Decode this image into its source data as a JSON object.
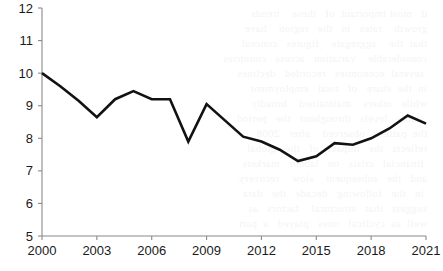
{
  "chart_data": {
    "type": "line",
    "title": "",
    "subtitle": "",
    "xlabel": "",
    "ylabel": "",
    "xlim": [
      2000,
      2021
    ],
    "ylim": [
      5,
      12
    ],
    "grid": false,
    "legend": null,
    "legend_position": "none",
    "y_ticks": [
      5,
      6,
      7,
      8,
      9,
      10,
      11,
      12
    ],
    "y_tick_labels": [
      "5",
      "6",
      "7",
      "8",
      "9",
      "10",
      "11",
      "12"
    ],
    "x_ticks": [
      2000,
      2003,
      2006,
      2009,
      2012,
      2015,
      2018,
      2021
    ],
    "x_tick_labels": [
      "2000",
      "2003",
      "2006",
      "2009",
      "2012",
      "2015",
      "2018",
      "2021"
    ],
    "x": [
      2000,
      2001,
      2002,
      2003,
      2004,
      2005,
      2006,
      2007,
      2008,
      2009,
      2010,
      2011,
      2012,
      2013,
      2014,
      2015,
      2016,
      2017,
      2018,
      2019,
      2020,
      2021
    ],
    "values": [
      10.0,
      9.6,
      9.15,
      8.65,
      9.2,
      9.45,
      9.2,
      9.2,
      7.9,
      9.05,
      8.55,
      8.05,
      7.9,
      7.65,
      7.3,
      7.45,
      7.85,
      7.8,
      8.0,
      8.3,
      8.7,
      8.45
    ],
    "series": [
      {
        "name": "series-1",
        "color": "#121212",
        "values": [
          10.0,
          9.6,
          9.15,
          8.65,
          9.2,
          9.45,
          9.2,
          9.2,
          7.9,
          9.05,
          8.55,
          8.05,
          7.9,
          7.65,
          7.3,
          7.45,
          7.85,
          7.8,
          8.0,
          8.3,
          8.7,
          8.45
        ]
      }
    ],
    "annotations": []
  },
  "background": {
    "bleed_text": "  d   most important  of   these    trends\n  growth    rates   in   the   region    have\n  that  the    aggregate    figures   conceal\n  considerable    variation   across   countries\n   several  economies   recorded   declines\n  in  the  share   of   total   employment\n  while   others    maintained    broadly\n   stable   levels   throughout   the   period\n  the  pattern   observed    after   2008\n  reflects   the   impact   of   the   global\n   financial   crisis   on   labour   markets\n  and   the   subsequent    slow    recovery\n   in   the   following   decade   the   data\n  suggest   that   structural    factors   as\n  well  as  cyclical   ones   played   a  part"
  },
  "colors": {
    "line": "#121212",
    "axis": "#8a8a8a",
    "text": "#1a1a1a",
    "background": "#ffffff"
  }
}
